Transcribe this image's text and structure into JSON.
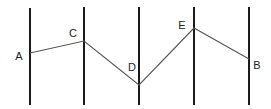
{
  "diagram": {
    "width": 271,
    "height": 109,
    "vertical_lines": [
      {
        "x": 30,
        "y1": 8,
        "y2": 105
      },
      {
        "x": 84,
        "y1": 7,
        "y2": 105
      },
      {
        "x": 139,
        "y1": 7,
        "y2": 105
      },
      {
        "x": 194,
        "y1": 7,
        "y2": 105
      },
      {
        "x": 249,
        "y1": 7,
        "y2": 105
      }
    ],
    "points": [
      {
        "label": "A",
        "x": 30,
        "y": 53,
        "label_x": 19,
        "label_y": 60
      },
      {
        "label": "C",
        "x": 84,
        "y": 41,
        "label_x": 73,
        "label_y": 37
      },
      {
        "label": "D",
        "x": 139,
        "y": 85,
        "label_x": 132,
        "label_y": 71
      },
      {
        "label": "E",
        "x": 194,
        "y": 28,
        "label_x": 182,
        "label_y": 29
      },
      {
        "label": "B",
        "x": 249,
        "y": 59,
        "label_x": 257,
        "label_y": 69
      }
    ],
    "path_order": [
      "A",
      "C",
      "D",
      "E",
      "B"
    ],
    "colors": {
      "vertical_line": "#1a1a1a",
      "path_line": "#555555",
      "label": "#222222",
      "background": "#ffffff"
    }
  }
}
